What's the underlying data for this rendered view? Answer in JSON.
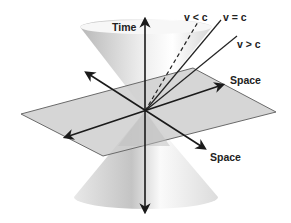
{
  "diagram": {
    "labels": {
      "time": "Time",
      "space_right": "Space",
      "space_bottom": "Space",
      "v_less_c": "v < c",
      "v_equal_c": "v = c",
      "v_greater_c": "v > c"
    },
    "colors": {
      "cone_light": "#f4f4f4",
      "cone_dark": "#bdbdbd",
      "plane_fill": "#cfcfcf",
      "plane_stroke": "#6a6a6a",
      "axis": "#1a1a1a"
    }
  }
}
